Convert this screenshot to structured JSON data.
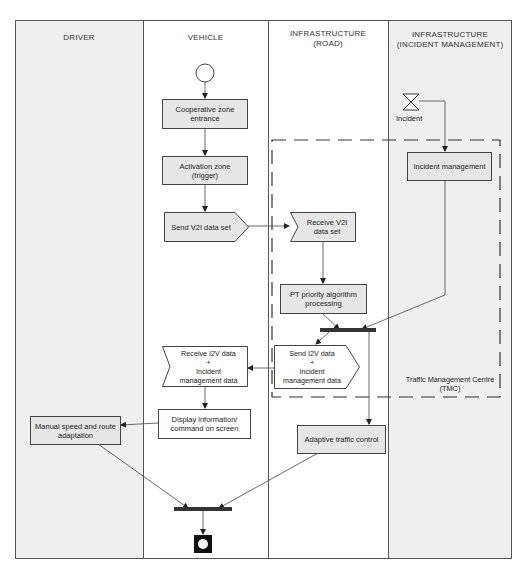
{
  "lanes": [
    {
      "id": "driver",
      "title": "DRIVER"
    },
    {
      "id": "vehicle",
      "title": "VEHICLE"
    },
    {
      "id": "road",
      "title": "INFRASTRUCTURE\n(ROAD)"
    },
    {
      "id": "incident",
      "title": "INFRASTRUCTURE\n(INCIDENT MANAGEMENT)"
    }
  ],
  "nodes": {
    "start": {
      "type": "initial"
    },
    "coop_zone": {
      "label": "Cooperative zone\nentrance"
    },
    "activation": {
      "label": "Activation zone\n(trigger)"
    },
    "send_v2i": {
      "label": "Send V2I data set"
    },
    "receive_v2i": {
      "label": "Receive V2I\ndata set"
    },
    "pt_priority": {
      "label": "PT priority algorithm\nprocessing"
    },
    "incident_event": {
      "label": "Incident"
    },
    "incident_mgmt": {
      "label": "Incident management"
    },
    "send_i2v": {
      "label": "Send I2V data\n+\nIncident\nmanagement data"
    },
    "receive_i2v": {
      "label": "Receive I2V data\n+\nIncident\nmanagement data"
    },
    "display_info": {
      "label": "Display information/\ncommand on screen"
    },
    "manual_speed": {
      "label": "Manual speed and route\nadaptation"
    },
    "adaptive_traffic": {
      "label": "Adaptive traffic control"
    },
    "end": {
      "type": "final"
    }
  },
  "tmc": {
    "label": "Traffic Management Centre\n(TMC)"
  },
  "colors": {
    "shaded_lane": "#efefef",
    "box_fill": "#e6e6e6",
    "line": "#444444",
    "bar": "#333333"
  }
}
